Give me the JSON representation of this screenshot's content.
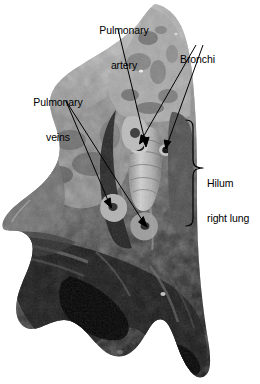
{
  "figure": {
    "type": "anatomical-photograph",
    "background_color": "#ffffff",
    "rendering": "grayscale"
  },
  "labels": {
    "pulmonary_artery": {
      "line1": "Pulmonary",
      "line2": "artery",
      "x": 88,
      "y": 2,
      "align": "center"
    },
    "bronchi": {
      "line1": "Bronchi",
      "x": 180,
      "y": 31,
      "align": "left"
    },
    "pulmonary_veins": {
      "line1": "Pulmonary",
      "line2": "veins",
      "x": 22,
      "y": 74,
      "align": "center"
    },
    "hilum_right_lung": {
      "line1": "Hilum",
      "line2": "right lung",
      "x": 207,
      "y": 155,
      "align": "left"
    }
  },
  "leader_lines": [
    {
      "name": "pulmonary-artery-leader",
      "from": [
        118,
        29
      ],
      "to": [
        146,
        146
      ],
      "arrow": true
    },
    {
      "name": "bronchi-leader-upper",
      "from": [
        196,
        45
      ],
      "to": [
        140,
        143
      ],
      "arrow": true
    },
    {
      "name": "bronchi-leader-lower",
      "from": [
        203,
        45
      ],
      "to": [
        166,
        148
      ],
      "arrow": true
    },
    {
      "name": "pulmonary-veins-leader-upper",
      "from": [
        66,
        101
      ],
      "to": [
        147,
        226
      ],
      "arrow": true
    },
    {
      "name": "pulmonary-veins-leader-lower",
      "from": [
        66,
        101
      ],
      "to": [
        112,
        207
      ],
      "arrow": true
    }
  ],
  "brace": {
    "name": "hilum-brace",
    "top_y": 120,
    "bottom_y": 226,
    "spine_x": 193,
    "tip_x": 203,
    "tip_y": 168
  },
  "colors": {
    "ink": "#000000",
    "background": "#ffffff",
    "tissue_light": "#b9b9b9",
    "tissue_mid": "#6f6f6f",
    "tissue_dark": "#262626",
    "tissue_darkest": "#0c0c0c"
  }
}
